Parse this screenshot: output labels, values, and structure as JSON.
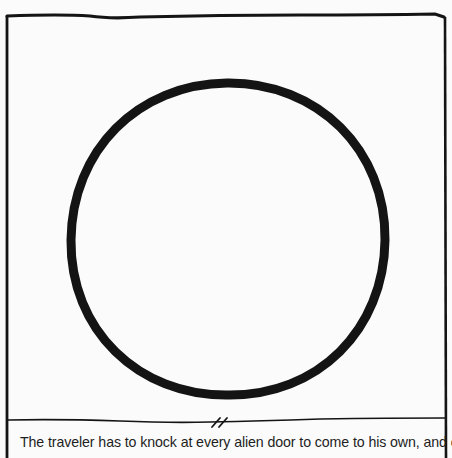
{
  "comic": {
    "panel": {
      "shape": "circle-outline",
      "stroke_color": "#141414",
      "background": "#fbfbfb"
    },
    "divider": {
      "icon": "break-mark-icon"
    },
    "caption": "The traveler has to knock at every alien door to come to his own, and one has to"
  }
}
